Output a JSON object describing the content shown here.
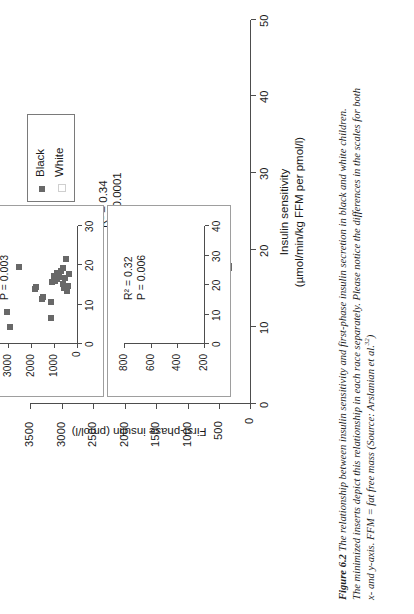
{
  "figure": {
    "number": "Figure 6.2",
    "caption_lines": [
      "The relationship between insulin sensitivity and first-phase insulin secretion in black and white children.",
      "The minimized inserts depict this relationship in each race separately. Please notice the differences in the scales for both",
      "x- and y-axis. FFM = fat free mass (Source: Arslanian et al."
    ],
    "caption_superscript": "32",
    "caption_tail": ")"
  },
  "chart_data": [
    {
      "id": "main",
      "type": "scatter",
      "title": "",
      "xlabel": "Insulin sensitivity",
      "xlabel_units": "(µmol/min/kg FFM per pmol/l)",
      "ylabel": "First-phase insulin (pmol/l)",
      "xlim": [
        0,
        50
      ],
      "ylim": [
        0,
        3500
      ],
      "xticks": [
        0,
        10,
        20,
        30,
        40,
        50
      ],
      "yticks": [
        0,
        500,
        1000,
        1500,
        2000,
        2500,
        3000,
        3500
      ],
      "grid": false,
      "annotations": {
        "r2": "R² = 0.34",
        "p": "P < 0.0001"
      },
      "legend": {
        "position": "upper-right",
        "entries": [
          {
            "label": "Black",
            "marker": "filled-square",
            "color": "#686868"
          },
          {
            "label": "White",
            "marker": "open-square",
            "color": "#ffffff"
          }
        ]
      },
      "series": [
        {
          "name": "Black",
          "points": [
            [
              4.0,
              2800
            ],
            [
              8.2,
              3020
            ],
            [
              19.9,
              2500
            ],
            [
              15.8,
              1500
            ],
            [
              16.2,
              1480
            ],
            [
              12.6,
              1280
            ],
            [
              13.4,
              1120
            ],
            [
              11.2,
              1050
            ],
            [
              6.4,
              1080
            ],
            [
              15.1,
              720
            ],
            [
              13.0,
              700
            ],
            [
              17.6,
              760
            ],
            [
              18.9,
              660
            ],
            [
              19.2,
              650
            ],
            [
              20.3,
              560
            ],
            [
              17.0,
              620
            ],
            [
              16.5,
              470
            ],
            [
              13.3,
              470
            ],
            [
              17.3,
              430
            ],
            [
              18.1,
              420
            ],
            [
              21.8,
              360
            ],
            [
              17.9,
              350
            ]
          ]
        },
        {
          "name": "White",
          "points": [
            [
              18.3,
              640
            ],
            [
              18.9,
              520
            ]
          ]
        }
      ]
    },
    {
      "id": "inset-black",
      "type": "scatter",
      "title": "",
      "xlim": [
        0,
        30
      ],
      "ylim": [
        0,
        4000
      ],
      "xticks": [
        0,
        10,
        20,
        30
      ],
      "yticks": [
        0,
        1000,
        2000,
        3000,
        4000
      ],
      "grid": false,
      "annotations": {
        "r2": "R² = 0.37",
        "p": "P = 0.003"
      },
      "series": [
        {
          "name": "Black",
          "points": [
            [
              4.2,
              2900
            ],
            [
              8.1,
              3050
            ],
            [
              19.6,
              2520
            ],
            [
              13.9,
              1820
            ],
            [
              14.6,
              1780
            ],
            [
              11.5,
              1520
            ],
            [
              12.0,
              1480
            ],
            [
              10.6,
              1130
            ],
            [
              6.6,
              1120
            ],
            [
              15.8,
              1080
            ],
            [
              16.0,
              950
            ],
            [
              16.4,
              880
            ],
            [
              17.4,
              980
            ],
            [
              18.0,
              860
            ],
            [
              17.1,
              790
            ],
            [
              18.6,
              700
            ],
            [
              19.4,
              620
            ],
            [
              15.3,
              600
            ],
            [
              14.2,
              560
            ],
            [
              16.8,
              520
            ],
            [
              21.6,
              460
            ],
            [
              13.6,
              430
            ],
            [
              14.8,
              380
            ],
            [
              17.8,
              360
            ]
          ]
        }
      ]
    },
    {
      "id": "inset-white",
      "type": "scatter",
      "title": "",
      "xlim": [
        0,
        40
      ],
      "ylim": [
        200,
        800
      ],
      "xticks": [
        0,
        10,
        20,
        30,
        40
      ],
      "yticks": [
        200,
        400,
        600,
        800
      ],
      "grid": false,
      "annotations": {
        "r2": "R² = 0.32",
        "p": "P = 0.006"
      },
      "series": [
        {
          "name": "White",
          "points": []
        }
      ]
    }
  ]
}
